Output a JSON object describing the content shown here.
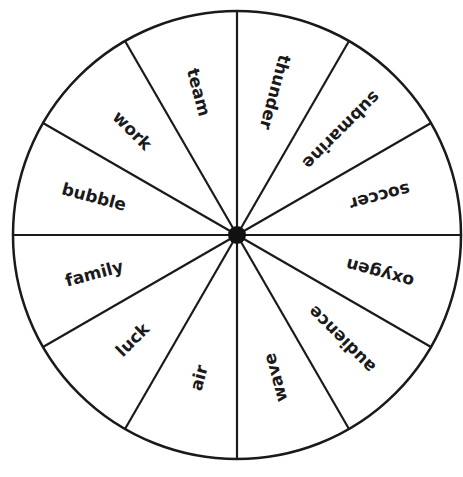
{
  "wheel": {
    "center": {
      "x": 237,
      "y": 235
    },
    "radius": 224,
    "hub_radius": 9,
    "line_color": "#1a1a1a",
    "fill_color": "#ffffff",
    "segments": [
      {
        "label": "soccer",
        "angle": 15
      },
      {
        "label": "submarine",
        "angle": 45
      },
      {
        "label": "thunder",
        "angle": 75
      },
      {
        "label": "team",
        "angle": 105
      },
      {
        "label": "work",
        "angle": 135
      },
      {
        "label": "bubble",
        "angle": 165
      },
      {
        "label": "family",
        "angle": 195
      },
      {
        "label": "luck",
        "angle": 225
      },
      {
        "label": "air",
        "angle": 255
      },
      {
        "label": "wave",
        "angle": 285
      },
      {
        "label": "audience",
        "angle": 315
      },
      {
        "label": "oxygen",
        "angle": 345
      }
    ]
  }
}
